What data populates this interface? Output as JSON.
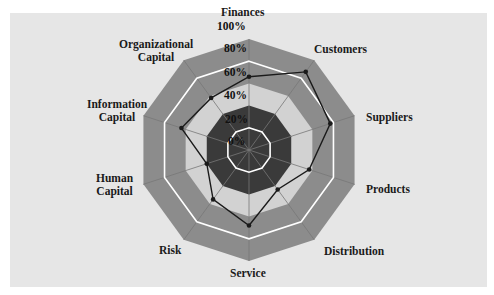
{
  "chart_data": {
    "type": "radar",
    "title": "",
    "categories": [
      "Finances",
      "Customers",
      "Suppliers",
      "Products",
      "Distribution",
      "Service",
      "Risk",
      "Human Capital",
      "Information Capital",
      "Organizational Capital"
    ],
    "series": [
      {
        "name": "Profile",
        "values": [
          66,
          87,
          77,
          57,
          44,
          68,
          55,
          40,
          64,
          58
        ]
      }
    ],
    "radial_ticks": [
      "0%",
      "20%",
      "40%",
      "60%",
      "80%",
      "100%"
    ],
    "rlim": [
      0,
      100
    ],
    "bands": [
      {
        "from": 0,
        "to": 40,
        "color": "#3a3a3a"
      },
      {
        "from": 40,
        "to": 60,
        "color": "#d2d2d2"
      },
      {
        "from": 60,
        "to": 100,
        "color": "#8c8c8c"
      }
    ],
    "ring_lines": [
      20,
      80
    ],
    "colors": {
      "panel": "#e6e6e6",
      "line": "#1a1a1a",
      "ring": "#ffffff",
      "spoke": "#777777"
    }
  },
  "labels": {
    "finances": "Finances",
    "customers": "Customers",
    "suppliers": "Suppliers",
    "products": "Products",
    "distribution": "Distribution",
    "service": "Service",
    "risk": "Risk",
    "human_1": "Human",
    "human_2": "Capital",
    "info_1": "Information",
    "info_2": "Capital",
    "org_1": "Organizational",
    "org_2": "Capital"
  },
  "ticks": {
    "t0": "0%",
    "t20": "20%",
    "t40": "40%",
    "t60": "60%",
    "t80": "80%",
    "t100": "100%"
  }
}
